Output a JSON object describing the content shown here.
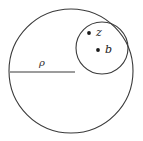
{
  "figure": {
    "background_color": "#ffffff",
    "stroke_color": "#3a3a3a",
    "label_color": "#1a1a1a",
    "width": 143,
    "height": 141
  },
  "outer_circle": {
    "name": "outer-circle",
    "center_x": 71,
    "center_y": 71,
    "radius": 62
  },
  "inner_circle": {
    "name": "inner-circle",
    "center_x": 102,
    "center_y": 48,
    "radius": 26
  },
  "radius_segment": {
    "name": "radius-line",
    "x1": 10,
    "y1": 72,
    "x2": 75,
    "y2": 72,
    "label": "ρ",
    "label_x": 42,
    "label_y": 66
  },
  "points": [
    {
      "name": "point-z",
      "label": "z",
      "dot_x": 89,
      "dot_y": 33,
      "label_x": 96,
      "label_y": 36
    },
    {
      "name": "point-b",
      "label": "b",
      "dot_x": 98,
      "dot_y": 50,
      "label_x": 105,
      "label_y": 53
    }
  ]
}
